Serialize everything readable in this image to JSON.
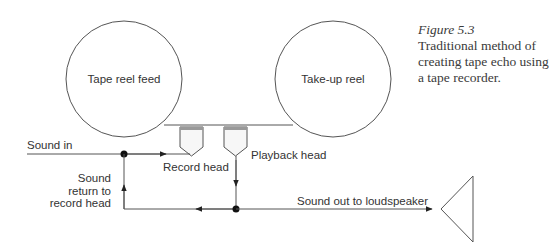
{
  "caption": {
    "figure_label": "Figure 5.3",
    "text": "Traditional method of creating tape echo using a tape recorder."
  },
  "diagram": {
    "reels": [
      {
        "id": "feed",
        "label": "Tape reel feed"
      },
      {
        "id": "takeup",
        "label": "Take-up reel"
      }
    ],
    "heads": [
      {
        "id": "record",
        "label": "Record head"
      },
      {
        "id": "playback",
        "label": "Playback head"
      }
    ],
    "signals": {
      "input": "Sound in",
      "return_line1": "Sound",
      "return_line2": "return to",
      "return_line3": "record head",
      "output": "Sound out to loudspeaker"
    },
    "colors": {
      "line": "#555555",
      "head_fill": "#f7f7f7",
      "head_cap": "#999999",
      "dot": "#111111"
    }
  }
}
